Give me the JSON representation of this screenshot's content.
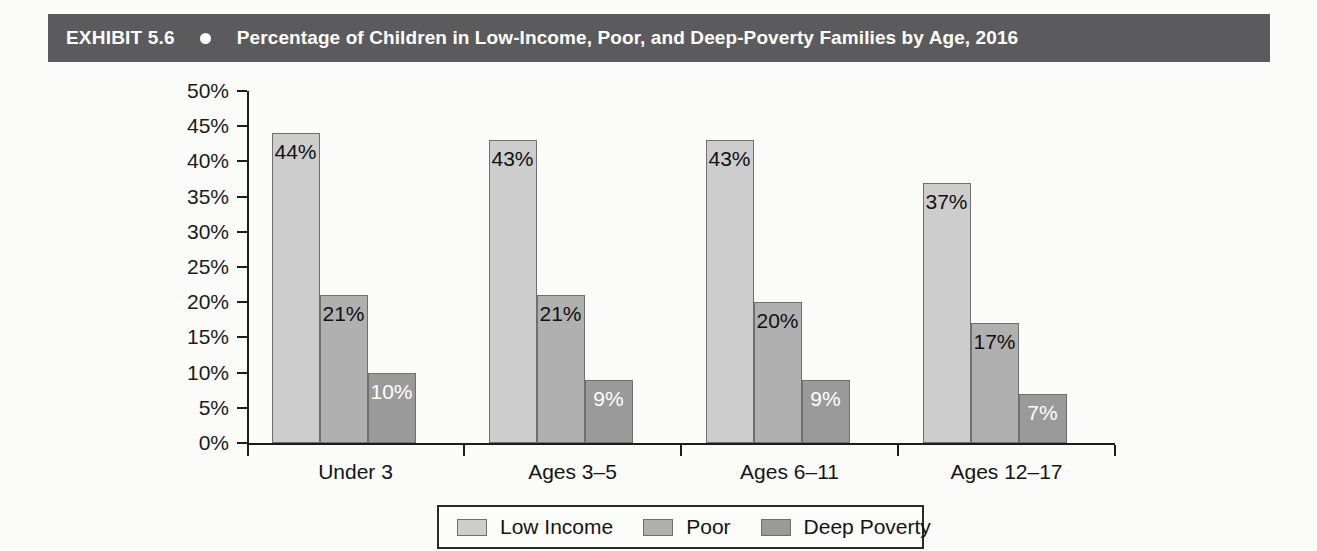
{
  "exhibit": {
    "label": "EXHIBIT 5.6",
    "bullet_icon": "bullet-dot-icon",
    "title": "Percentage of Children in Low-Income, Poor, and Deep-Poverty Families by Age, 2016",
    "header_bg": "#5b5b5d",
    "header_text_color": "#ffffff"
  },
  "chart_data": {
    "type": "bar",
    "title": "Percentage of Children in Low-Income, Poor, and Deep-Poverty Families by Age, 2016",
    "xlabel": "",
    "ylabel": "",
    "ylim": [
      0,
      50
    ],
    "y_tick_values": [
      0,
      5,
      10,
      15,
      20,
      25,
      30,
      35,
      40,
      45,
      50
    ],
    "y_tick_labels": [
      "0%",
      "5%",
      "10%",
      "15%",
      "20%",
      "25%",
      "30%",
      "35%",
      "40%",
      "45%",
      "50%"
    ],
    "grid": false,
    "legend_position": "bottom",
    "categories": [
      "Under 3",
      "Ages 3–5",
      "Ages 6–11",
      "Ages 12–17"
    ],
    "series": [
      {
        "name": "Low Income",
        "color": "#cdcdcd",
        "values": [
          44,
          43,
          43,
          37
        ],
        "labels": [
          "44%",
          "43%",
          "43%",
          "37%"
        ],
        "label_colors": [
          "dark",
          "dark",
          "dark",
          "dark"
        ]
      },
      {
        "name": "Poor",
        "color": "#b0b0b0",
        "values": [
          21,
          21,
          20,
          17
        ],
        "labels": [
          "21%",
          "21%",
          "20%",
          "17%"
        ],
        "label_colors": [
          "dark",
          "dark",
          "dark",
          "dark"
        ]
      },
      {
        "name": "Deep Poverty",
        "color": "#9a9a9a",
        "values": [
          10,
          9,
          9,
          7
        ],
        "labels": [
          "10%",
          "9%",
          "9%",
          "7%"
        ],
        "label_colors": [
          "light",
          "light",
          "light",
          "light"
        ]
      }
    ]
  },
  "legend": {
    "items": [
      {
        "label": "Low Income",
        "color": "#cdcdcd"
      },
      {
        "label": "Poor",
        "color": "#b0b0b0"
      },
      {
        "label": "Deep Poverty",
        "color": "#9a9a9a"
      }
    ]
  }
}
